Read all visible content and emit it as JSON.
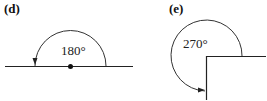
{
  "panels": [
    {
      "label": "(d)",
      "angle_text": "180°"
    },
    {
      "label": "(e)",
      "angle_text": "270°"
    }
  ],
  "colors": {
    "stroke": "#222222",
    "background": "#ffffff"
  }
}
